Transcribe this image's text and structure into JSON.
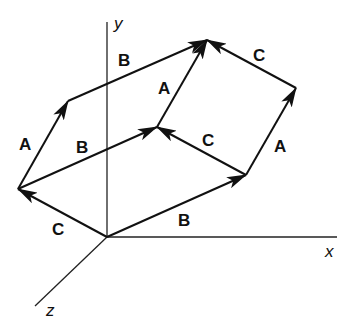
{
  "diagram": {
    "axes": {
      "x_label": "x",
      "y_label": "y",
      "z_label": "z"
    },
    "vector_labels": {
      "A": "A",
      "B": "B",
      "C": "C"
    },
    "labels": [
      {
        "id": "c_bottom_left",
        "text": "C"
      },
      {
        "id": "a_left",
        "text": "A"
      },
      {
        "id": "b_top_left",
        "text": "B"
      },
      {
        "id": "b_middle",
        "text": "B"
      },
      {
        "id": "a_center",
        "text": "A"
      },
      {
        "id": "c_middle",
        "text": "C"
      },
      {
        "id": "c_top_right",
        "text": "C"
      },
      {
        "id": "a_right",
        "text": "A"
      },
      {
        "id": "b_bottom",
        "text": "B"
      }
    ],
    "colors": {
      "line": "#111111",
      "background": "#ffffff"
    }
  }
}
